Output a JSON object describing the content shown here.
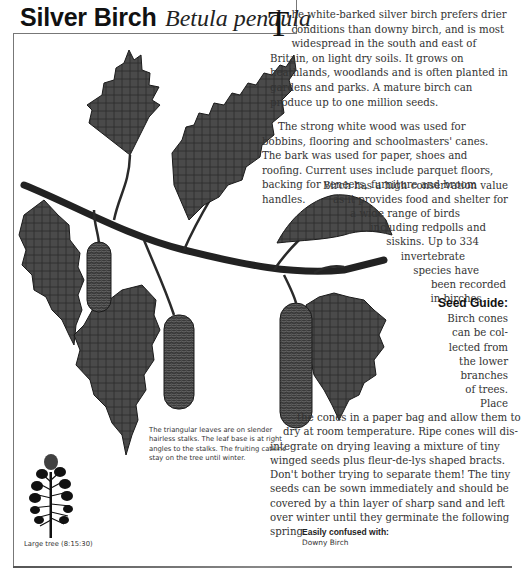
{
  "header": {
    "common_name": "Silver Birch",
    "latin_name": "Betula pendula"
  },
  "intro": {
    "dropcap": "T",
    "paragraph_1_rest": "he white-barked silver birch prefers drier conditions than downy birch, and is most widespread in the south and east of Britain, on light dry soils. It grows on heathlands, woodlands and is often planted in gardens and parks. A mature birch can produce up to one million seeds.",
    "paragraph_2": "The strong white wood was used for bobbins, flooring and schoolmasters' canes. The bark was used for paper, shoes and roofing. Current uses include parquet floors, backing for veneers, furniture and broom handles.",
    "paragraph_3_lines": [
      "Birch has a high conservation value",
      "as it provides food and shelter for",
      "a wide range of birds",
      "including redpolls and",
      "siskins. Up to 334",
      "invertebrate",
      "species have",
      "been recorded",
      "in birches."
    ]
  },
  "seed_guide": {
    "heading": "Seed Guide:",
    "lines": [
      "Birch cones",
      "can be col-",
      "lected from",
      "the lower",
      "branches",
      "of trees.",
      "Place",
      "the cones in a paper bag and allow them to",
      "dry at room temperature. Ripe cones will dis-",
      "integrate on drying leaving a mixture of tiny",
      "winged seeds plus fleur-de-lys shaped bracts.",
      "Don't bother trying to separate them! The tiny",
      "seeds can be sown immediately and should be",
      "covered by a thin layer of sharp sand and left",
      "over winter until they germinate the following",
      "spring."
    ]
  },
  "illustration_caption": "The triangular leaves are on slender hairless stalks. The leaf base is at right angles to the stalks. The fruiting catkins stay on the tree until winter.",
  "tree_caption": "Large tree (8:15:30)",
  "confused_with": {
    "heading": "Easily confused with:",
    "value": "Downy Birch"
  },
  "colors": {
    "leaf": "#4a4a4a",
    "leaf_vein": "#1a1a1a",
    "text": "#333333",
    "frame": "#777777"
  }
}
